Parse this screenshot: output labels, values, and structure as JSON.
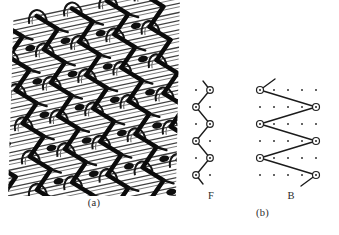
{
  "figure": {
    "caption_a": "(a)",
    "caption_b": "(b)",
    "panel_a_name": "warp-knitted-fabric-photograph",
    "panel_b_name": "lapping-diagram"
  },
  "diagrams": {
    "front": {
      "label": "F",
      "full_name": "front guide bar",
      "grid": {
        "columns": 2,
        "rows": 6,
        "col_spacing": 14,
        "row_spacing": 17
      },
      "nodes": [
        {
          "col": 1,
          "row": 0
        },
        {
          "col": 0,
          "row": 1
        },
        {
          "col": 1,
          "row": 2
        },
        {
          "col": 0,
          "row": 3
        },
        {
          "col": 1,
          "row": 4
        },
        {
          "col": 0,
          "row": 5
        }
      ],
      "tail_top": {
        "from_col": 1,
        "from_row": 0,
        "dx": 8,
        "dy": -9
      },
      "tail_bottom": {
        "from_col": 0,
        "from_row": 5,
        "dx": 8,
        "dy": 9
      },
      "underlap_span": 1
    },
    "back": {
      "label": "B",
      "full_name": "back guide bar",
      "grid": {
        "columns": 5,
        "rows": 6,
        "col_spacing": 14,
        "row_spacing": 17
      },
      "nodes": [
        {
          "col": 0,
          "row": 0
        },
        {
          "col": 4,
          "row": 1
        },
        {
          "col": 0,
          "row": 2
        },
        {
          "col": 4,
          "row": 3
        },
        {
          "col": 0,
          "row": 4
        },
        {
          "col": 4,
          "row": 5
        }
      ],
      "tail_top": {
        "from_col": 0,
        "from_row": 0,
        "dx": 15,
        "dy": -11
      },
      "tail_bottom": {
        "from_col": 4,
        "from_row": 5,
        "dx": -15,
        "dy": 11
      },
      "underlap_span": 4
    }
  },
  "colors": {
    "ink": "#1a1a1a",
    "paper": "#ffffff",
    "dot": "#3a3a3a",
    "node_fill": "#ffffff",
    "node_stroke": "#2b2b2b",
    "thread_dark": "#111111",
    "thread_light": "#4a4a4a"
  }
}
